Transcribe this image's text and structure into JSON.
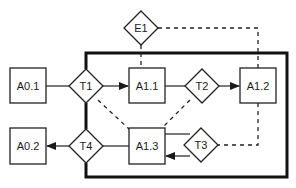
{
  "diagram": {
    "boundary": {
      "x": 86,
      "y": 53,
      "w": 201,
      "h": 124
    },
    "nodes": {
      "A0_1": {
        "label": "A0.1",
        "type": "box",
        "x": 10,
        "y": 68,
        "w": 36,
        "h": 35
      },
      "A0_2": {
        "label": "A0.2",
        "type": "box",
        "x": 10,
        "y": 128,
        "w": 36,
        "h": 36
      },
      "A1_1": {
        "label": "A1.1",
        "type": "box",
        "x": 129,
        "y": 68,
        "w": 36,
        "h": 35
      },
      "A1_2": {
        "label": "A1.2",
        "type": "box",
        "x": 240,
        "y": 68,
        "w": 36,
        "h": 35
      },
      "A1_3": {
        "label": "A1.3",
        "type": "box",
        "x": 129,
        "y": 128,
        "w": 36,
        "h": 36
      },
      "T1": {
        "label": "T1",
        "type": "diamond",
        "cx": 86,
        "cy": 86,
        "r": 17
      },
      "T2": {
        "label": "T2",
        "type": "diamond",
        "cx": 202,
        "cy": 86,
        "r": 17
      },
      "T3": {
        "label": "T3",
        "type": "diamond",
        "cx": 201,
        "cy": 145,
        "r": 17
      },
      "T4": {
        "label": "T4",
        "type": "diamond",
        "cx": 86,
        "cy": 146,
        "r": 17
      },
      "E1": {
        "label": "E1",
        "type": "diamond",
        "cx": 141,
        "cy": 28,
        "r": 17
      }
    },
    "edges": [
      {
        "from": "A0.1",
        "to": "T1",
        "style": "solid",
        "arrow": false
      },
      {
        "from": "T1",
        "to": "A1.1",
        "style": "solid",
        "arrow": true
      },
      {
        "from": "A1.1",
        "to": "T2",
        "style": "solid",
        "arrow": false
      },
      {
        "from": "T2",
        "to": "A1.2",
        "style": "solid",
        "arrow": true
      },
      {
        "from": "A1.3",
        "to": "T3",
        "style": "solid",
        "arrow": false
      },
      {
        "from": "T3",
        "to": "A1.3",
        "style": "solid",
        "arrow": true
      },
      {
        "from": "A1.3",
        "to": "T4",
        "style": "solid",
        "arrow": false
      },
      {
        "from": "T4",
        "to": "A0.2",
        "style": "solid",
        "arrow": true
      },
      {
        "from": "T1",
        "to": "T4",
        "style": "thick",
        "arrow": false
      },
      {
        "from": "E1",
        "to": "A1.1",
        "style": "dashed",
        "arrow": false
      },
      {
        "from": "E1",
        "to": "A1.2",
        "style": "dashed",
        "arrow": false
      },
      {
        "from": "T1",
        "to": "A1.3",
        "style": "dashed",
        "arrow": false
      },
      {
        "from": "T2",
        "to": "A1.3",
        "style": "dashed",
        "arrow": false
      },
      {
        "from": "A1.2",
        "to": "T3",
        "style": "dashed",
        "arrow": false
      }
    ]
  }
}
